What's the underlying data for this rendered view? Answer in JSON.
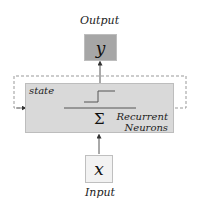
{
  "diagram": {
    "output": {
      "caption": "Output",
      "symbol": "y"
    },
    "input": {
      "caption": "Input",
      "symbol": "x"
    },
    "neurons": {
      "state_label": "state",
      "sum_symbol": "Σ",
      "title_line1": "Recurrent",
      "title_line2": "Neurons"
    },
    "colors": {
      "output_fill": "#a6a6a6",
      "neuron_fill": "#d9d9d9",
      "input_fill": "#f2f2f2",
      "dashed": "#999999"
    }
  }
}
